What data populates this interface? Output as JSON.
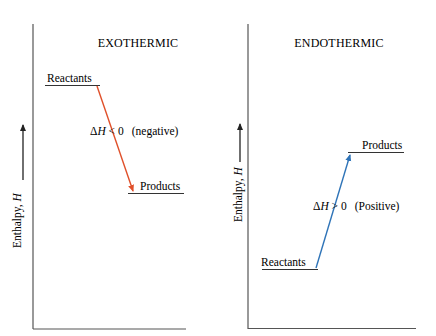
{
  "panels": [
    {
      "id": "exothermic",
      "title": "EXOTHERMIC",
      "y_axis_label_text": "Enthalpy, ",
      "y_axis_label_var": "H",
      "reactants_label": "Reactants",
      "products_label": "Products",
      "delta_h_symbol": "ΔH",
      "delta_h_relation": " < 0",
      "delta_h_note": "(negative)",
      "arrow_color": "#e0502a",
      "direction": "down"
    },
    {
      "id": "endothermic",
      "title": "ENDOTHERMIC",
      "y_axis_label_text": "Enthalpy, ",
      "y_axis_label_var": "H",
      "reactants_label": "Reactants",
      "products_label": "Products",
      "delta_h_symbol": "ΔH",
      "delta_h_relation": " > 0",
      "delta_h_note": "(Positive)",
      "arrow_color": "#2f74b8",
      "direction": "up"
    }
  ],
  "colors": {
    "axis": "#555555",
    "level_line": "#333333",
    "text": "#222222"
  }
}
